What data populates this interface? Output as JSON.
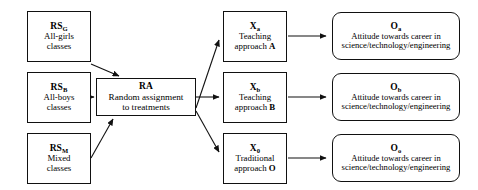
{
  "diagram": {
    "background": "#ffffff",
    "line_color": "#111111",
    "text_color": "#000000",
    "nodes": {
      "rs_g": {
        "code": "RS",
        "subscript": "G",
        "desc": "All-girls\nclasses"
      },
      "rs_b": {
        "code": "RS",
        "subscript": "B",
        "desc": "All-boys\nclasses"
      },
      "rs_m": {
        "code": "RS",
        "subscript": "M",
        "desc": "Mixed\nclasses"
      },
      "ra": {
        "code": "RA",
        "subscript": "",
        "desc": "Random assignment\nto treatments"
      },
      "x_a": {
        "code": "X",
        "subscript": "a",
        "desc_pre": "Teaching\napproach ",
        "desc_bold": "A"
      },
      "x_b": {
        "code": "X",
        "subscript": "b",
        "desc_pre": "Teaching\napproach ",
        "desc_bold": "B"
      },
      "x_o": {
        "code": "X",
        "subscript": "0",
        "desc_pre": "Traditional\napproach ",
        "desc_bold": "O"
      },
      "o_a": {
        "code": "O",
        "subscript": "a",
        "desc": "Attitude towards career in\nscience/technology/engineering"
      },
      "o_b": {
        "code": "O",
        "subscript": "b",
        "desc": "Attitude towards career in\nscience/technology/engineering"
      },
      "o_o": {
        "code": "O",
        "subscript": "o",
        "desc": "Attitude towards career in\nscience/technology/engineering"
      }
    },
    "edges": [
      {
        "name": "rs-g-to-ra",
        "from": "rs_g",
        "to": "ra"
      },
      {
        "name": "rs-b-to-ra",
        "from": "rs_b",
        "to": "ra"
      },
      {
        "name": "rs-m-to-ra",
        "from": "rs_m",
        "to": "ra"
      },
      {
        "name": "ra-to-x-a",
        "from": "ra",
        "to": "x_a"
      },
      {
        "name": "ra-to-x-b",
        "from": "ra",
        "to": "x_b"
      },
      {
        "name": "ra-to-x-o",
        "from": "ra",
        "to": "x_o"
      },
      {
        "name": "x-a-to-o-a",
        "from": "x_a",
        "to": "o_a"
      },
      {
        "name": "x-b-to-o-b",
        "from": "x_b",
        "to": "o_b"
      },
      {
        "name": "x-o-to-o-o",
        "from": "x_o",
        "to": "o_o"
      }
    ]
  }
}
